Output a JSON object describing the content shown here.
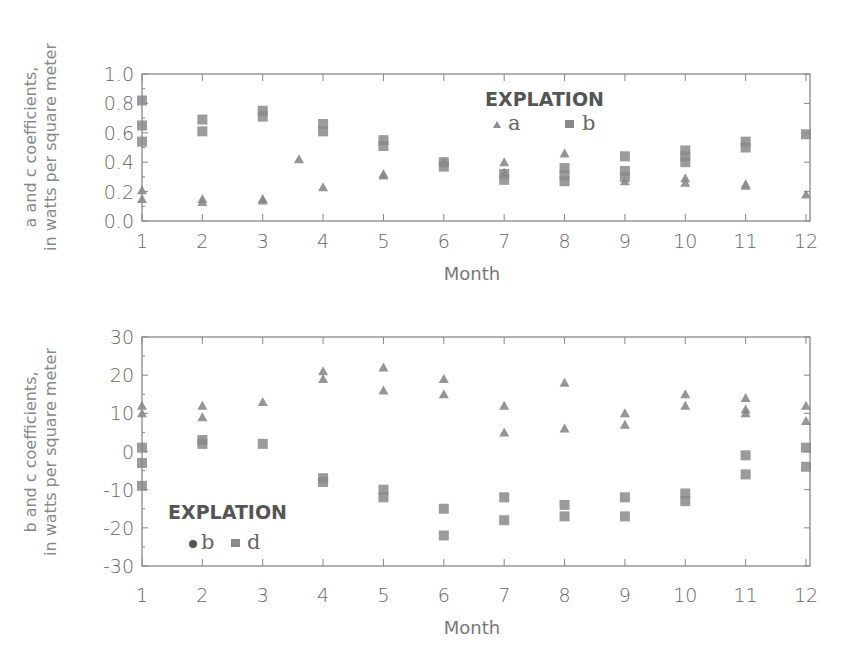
{
  "chart_data": [
    {
      "type": "scatter",
      "title": "",
      "xlabel": "Month",
      "ylabel": "a and c coefficients, in watts per square meter",
      "ylabel_lines": [
        "a and c coefficients,",
        "in watts per square meter"
      ],
      "xlim": [
        1,
        12
      ],
      "ylim": [
        0.0,
        1.0
      ],
      "x_ticks": [
        "1",
        "2",
        "3",
        "4",
        "5",
        "6",
        "7",
        "8",
        "9",
        "10",
        "11",
        "12"
      ],
      "y_ticks": [
        "0.0",
        "0.2",
        "0.4",
        "0.6",
        "0.8",
        "1.0"
      ],
      "grid": false,
      "legend": {
        "title": "EXPLATION",
        "entries": [
          "a",
          "b"
        ],
        "position": "upper right"
      },
      "series": [
        {
          "name": "a",
          "marker": "triangle",
          "points": [
            [
              1,
              0.21
            ],
            [
              1,
              0.15
            ],
            [
              2,
              0.15
            ],
            [
              2,
              0.13
            ],
            [
              3,
              0.15
            ],
            [
              3,
              0.14
            ],
            [
              3.6,
              0.42
            ],
            [
              4,
              0.23
            ],
            [
              5,
              0.32
            ],
            [
              5,
              0.31
            ],
            [
              6,
              0.4
            ],
            [
              7,
              0.4
            ],
            [
              7,
              0.33
            ],
            [
              8,
              0.46
            ],
            [
              9,
              0.27
            ],
            [
              10,
              0.29
            ],
            [
              10,
              0.26
            ],
            [
              11,
              0.25
            ],
            [
              11,
              0.24
            ],
            [
              12,
              0.18
            ]
          ]
        },
        {
          "name": "b",
          "marker": "square",
          "points": [
            [
              1,
              0.82
            ],
            [
              1,
              0.65
            ],
            [
              1,
              0.54
            ],
            [
              2,
              0.69
            ],
            [
              2,
              0.61
            ],
            [
              3,
              0.75
            ],
            [
              3,
              0.71
            ],
            [
              4,
              0.66
            ],
            [
              4,
              0.61
            ],
            [
              5,
              0.55
            ],
            [
              5,
              0.51
            ],
            [
              6,
              0.4
            ],
            [
              6,
              0.37
            ],
            [
              7,
              0.32
            ],
            [
              7,
              0.28
            ],
            [
              8,
              0.36
            ],
            [
              8,
              0.31
            ],
            [
              8,
              0.27
            ],
            [
              9,
              0.44
            ],
            [
              9,
              0.34
            ],
            [
              9,
              0.3
            ],
            [
              10,
              0.48
            ],
            [
              10,
              0.44
            ],
            [
              10,
              0.4
            ],
            [
              11,
              0.54
            ],
            [
              11,
              0.5
            ],
            [
              12,
              0.59
            ]
          ]
        }
      ]
    },
    {
      "type": "scatter",
      "title": "",
      "xlabel": "Month",
      "ylabel": "b and c coefficients, in watts per square meter",
      "ylabel_lines": [
        "b and c coefficients,",
        "in watts per square meter"
      ],
      "xlim": [
        1,
        12
      ],
      "ylim": [
        -30,
        30
      ],
      "x_ticks": [
        "1",
        "2",
        "3",
        "4",
        "5",
        "6",
        "7",
        "8",
        "9",
        "10",
        "11",
        "12"
      ],
      "y_ticks": [
        "-30",
        "-20",
        "-10",
        "0",
        "10",
        "20",
        "30"
      ],
      "grid": false,
      "legend": {
        "title": "EXPLATION",
        "entries": [
          "b",
          "d"
        ],
        "position": "lower left"
      },
      "series": [
        {
          "name": "b",
          "marker": "triangle",
          "points": [
            [
              1,
              12
            ],
            [
              1,
              10
            ],
            [
              2,
              12
            ],
            [
              2,
              9
            ],
            [
              3,
              13
            ],
            [
              4,
              21
            ],
            [
              4,
              19
            ],
            [
              5,
              22
            ],
            [
              5,
              16
            ],
            [
              6,
              19
            ],
            [
              6,
              15
            ],
            [
              7,
              12
            ],
            [
              7,
              5
            ],
            [
              8,
              18
            ],
            [
              8,
              6
            ],
            [
              9,
              10
            ],
            [
              9,
              7
            ],
            [
              10,
              15
            ],
            [
              10,
              12
            ],
            [
              11,
              14
            ],
            [
              11,
              11
            ],
            [
              11,
              10
            ],
            [
              12,
              12
            ],
            [
              12,
              8
            ]
          ]
        },
        {
          "name": "d",
          "marker": "square",
          "points": [
            [
              1,
              1
            ],
            [
              1,
              -3
            ],
            [
              1,
              -9
            ],
            [
              2,
              3
            ],
            [
              2,
              2
            ],
            [
              3,
              2
            ],
            [
              4,
              -7
            ],
            [
              4,
              -8
            ],
            [
              5,
              -10
            ],
            [
              5,
              -12
            ],
            [
              6,
              -15
            ],
            [
              6,
              -22
            ],
            [
              7,
              -12
            ],
            [
              7,
              -18
            ],
            [
              8,
              -14
            ],
            [
              8,
              -17
            ],
            [
              9,
              -12
            ],
            [
              9,
              -17
            ],
            [
              10,
              -11
            ],
            [
              10,
              -13
            ],
            [
              11,
              -1
            ],
            [
              11,
              -6
            ],
            [
              12,
              1
            ],
            [
              12,
              -4
            ]
          ]
        }
      ]
    }
  ],
  "colors": {
    "marker": "#8a8a8a",
    "axis": "#888888",
    "text": "#666666"
  }
}
